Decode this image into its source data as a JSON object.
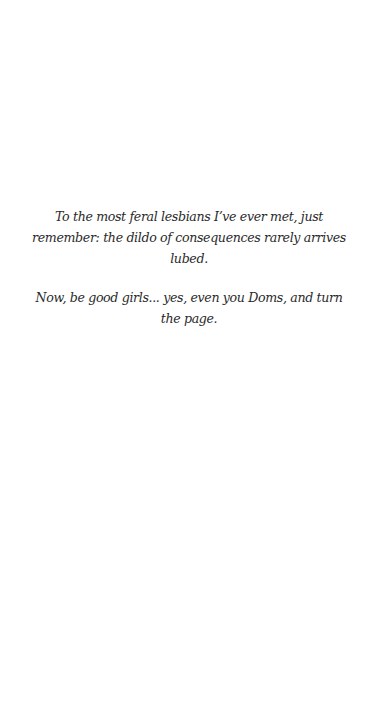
{
  "page": {
    "background": "#ffffff",
    "text_color": "#2a2a2a"
  },
  "dedication": {
    "paragraphs": [
      "To the most feral lesbians I’ve ever met, just remember: the dildo of consequences rarely arrives lubed.",
      "Now, be good girls... yes, even you Doms, and turn the page."
    ]
  }
}
